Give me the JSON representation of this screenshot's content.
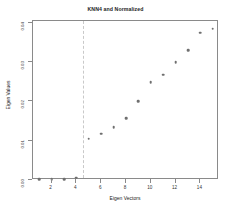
{
  "chart_data": {
    "type": "scatter",
    "title": "KNN4 and Normalized",
    "xlabel": "Eigen Vectors",
    "ylabel": "Eigen Values",
    "x": [
      1,
      2,
      3,
      4,
      5,
      6,
      7,
      8,
      9,
      10,
      11,
      12,
      13,
      14,
      15
    ],
    "values": [
      0.0002,
      0.0002,
      0.0002,
      0.0006,
      0.0105,
      0.0118,
      0.0135,
      0.0157,
      0.02,
      0.0249,
      0.0268,
      0.03,
      0.033,
      0.0375,
      0.0385
    ],
    "xlim": [
      0.5,
      15.5
    ],
    "ylim": [
      0.0,
      0.0405
    ],
    "xticks": [
      2,
      4,
      6,
      8,
      10,
      12,
      14
    ],
    "xtick_labels": [
      "2",
      "4",
      "6",
      "8",
      "10",
      "12",
      "14"
    ],
    "yticks": [
      0.0,
      0.01,
      0.02,
      0.03,
      0.04
    ],
    "ytick_labels": [
      "0.00",
      "0.01",
      "0.02",
      "0.03",
      "0.04"
    ],
    "grid": false,
    "legend": null,
    "annotations": [
      {
        "name": "eigengap-vertical-line",
        "type": "vline",
        "x": 4.5,
        "style": "dashed",
        "color": "#c9c9c9"
      }
    ],
    "marker": {
      "shape": "circle",
      "color": "#6f6f6f",
      "size": 2.6
    }
  }
}
